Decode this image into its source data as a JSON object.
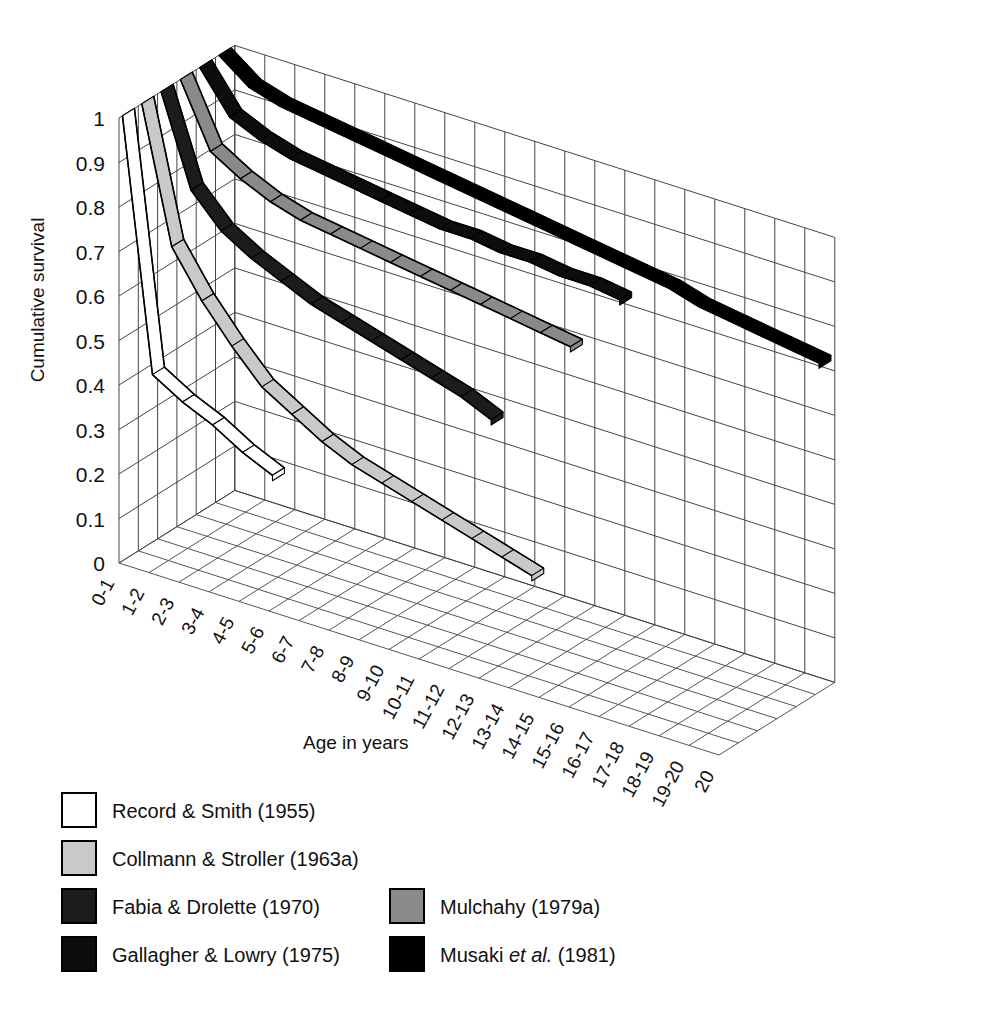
{
  "figure": {
    "caption": ""
  },
  "axes": {
    "y_title": "Cumulative survival",
    "x_title": "Age in years",
    "y_ticks": [
      "0",
      "0.1",
      "0.2",
      "0.3",
      "0.4",
      "0.5",
      "0.6",
      "0.7",
      "0.8",
      "0.9",
      "1"
    ],
    "x_ticks": [
      "0-1",
      "1-2",
      "2-3",
      "3-4",
      "4-5",
      "5-6",
      "6-7",
      "7-8",
      "8-9",
      "9-10",
      "10-11",
      "11-12",
      "12-13",
      "13-14",
      "14-15",
      "15-16",
      "16-17",
      "17-18",
      "18-19",
      "19-20",
      "20"
    ]
  },
  "legend": {
    "column_left": [
      {
        "label": "Record & Smith (1955)",
        "color": "#ffffff"
      },
      {
        "label": "Collmann & Stroller (1963a)",
        "color": "#c9c9c9"
      },
      {
        "label": "Fabia & Drolette (1970)",
        "color": "#1c1c1c"
      },
      {
        "label": "Gallagher & Lowry (1975)",
        "color": "#0d0d0d"
      }
    ],
    "column_right": [
      {
        "label": "Mulchahy (1979a)",
        "color": "#8a8a8a"
      },
      {
        "label_pre": "Musaki ",
        "label_italic": "et al.",
        "label_post": " (1981)",
        "label": "Musaki et al. (1981)",
        "color": "#000000"
      }
    ]
  },
  "chart_data": {
    "type": "line",
    "title": "",
    "subtitle": "",
    "xlabel": "Age in years",
    "ylabel": "Cumulative survival",
    "projection": "3d-ribbon",
    "grid": true,
    "legend_position": "below-left",
    "ylim": [
      0,
      1
    ],
    "categories": [
      "0-1",
      "1-2",
      "2-3",
      "3-4",
      "4-5",
      "5-6",
      "6-7",
      "7-8",
      "8-9",
      "9-10",
      "10-11",
      "11-12",
      "12-13",
      "13-14",
      "14-15",
      "15-16",
      "16-17",
      "17-18",
      "18-19",
      "19-20",
      "20"
    ],
    "series": [
      {
        "name": "Record & Smith (1955)",
        "year": 1955,
        "color": "#ffffff",
        "depth_index": 0,
        "x": [
          0,
          1,
          2,
          3,
          4,
          5
        ],
        "values": [
          1.0,
          0.44,
          0.4,
          0.37,
          0.33,
          0.3
        ]
      },
      {
        "name": "Collmann & Stroller (1963a)",
        "year": 1963,
        "color": "#c9c9c9",
        "depth_index": 1,
        "x": [
          0,
          1,
          2,
          3,
          4,
          5,
          6,
          7,
          8,
          9,
          10,
          11,
          12,
          13
        ],
        "values": [
          1.0,
          0.7,
          0.6,
          0.52,
          0.45,
          0.41,
          0.37,
          0.34,
          0.32,
          0.3,
          0.28,
          0.26,
          0.24,
          0.22
        ]
      },
      {
        "name": "Fabia & Drolette (1970)",
        "year": 1970,
        "color": "#1c1c1c",
        "depth_index": 2,
        "x": [
          0,
          1,
          2,
          3,
          4,
          5,
          6,
          7,
          8,
          9,
          10,
          11
        ],
        "values": [
          1.0,
          0.8,
          0.73,
          0.69,
          0.66,
          0.63,
          0.61,
          0.59,
          0.57,
          0.55,
          0.53,
          0.5
        ]
      },
      {
        "name": "Mulchahy (1979a)",
        "year": 1979,
        "color": "#8a8a8a",
        "depth_index": 3,
        "x": [
          0,
          1,
          2,
          3,
          4,
          5,
          6,
          7,
          8,
          9,
          10,
          11,
          12,
          13
        ],
        "values": [
          1.0,
          0.86,
          0.82,
          0.79,
          0.77,
          0.76,
          0.75,
          0.74,
          0.73,
          0.72,
          0.71,
          0.7,
          0.69,
          0.68
        ]
      },
      {
        "name": "Gallagher & Lowry (1975)",
        "year": 1975,
        "color": "#0d0d0d",
        "depth_index": 4,
        "x": [
          0,
          1,
          2,
          3,
          4,
          5,
          6,
          7,
          8,
          9,
          10,
          11,
          12,
          13,
          14
        ],
        "values": [
          1.0,
          0.91,
          0.88,
          0.86,
          0.85,
          0.84,
          0.83,
          0.82,
          0.81,
          0.81,
          0.8,
          0.8,
          0.79,
          0.79,
          0.78
        ]
      },
      {
        "name": "Musaki et al. (1981)",
        "year": 1981,
        "color": "#000000",
        "depth_index": 5,
        "x": [
          0,
          1,
          2,
          3,
          4,
          5,
          6,
          7,
          8,
          9,
          10,
          11,
          12,
          13,
          14,
          15,
          16,
          17,
          18,
          19,
          20
        ],
        "values": [
          1.0,
          0.95,
          0.93,
          0.92,
          0.91,
          0.9,
          0.89,
          0.88,
          0.87,
          0.86,
          0.85,
          0.84,
          0.83,
          0.82,
          0.81,
          0.8,
          0.78,
          0.77,
          0.76,
          0.75,
          0.74
        ]
      }
    ]
  }
}
